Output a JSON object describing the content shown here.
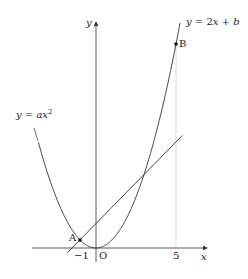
{
  "diagram": {
    "axes": {
      "x_label": "x",
      "y_label": "y",
      "origin_label": "O",
      "x_ticks": [
        {
          "value": -1,
          "label": "−1"
        },
        {
          "value": 5,
          "label": "5"
        }
      ]
    },
    "curves": {
      "parabola": {
        "label_prefix": "y = ax",
        "label_exp": "2",
        "a": 1
      },
      "line": {
        "label": "y = 2x + b",
        "slope": 2,
        "b": 3
      }
    },
    "points": [
      {
        "name": "A",
        "x": -1,
        "y": 1
      },
      {
        "name": "B",
        "x": 5,
        "y": 25
      }
    ],
    "colors": {
      "stroke": "#333333",
      "guide": "#cccccc",
      "text": "#222222"
    }
  }
}
